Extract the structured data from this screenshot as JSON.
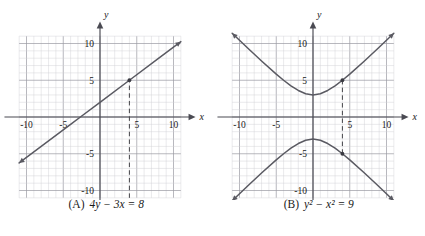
{
  "figure": {
    "background": "#ffffff",
    "panel_count": 2
  },
  "style": {
    "minor_grid_color": "#cfcfd4",
    "major_grid_color": "#9a9aa2",
    "axis_color": "#4a4a52",
    "curve_color": "#5a5a62",
    "dash_color": "#444448",
    "marker_color": "#3a3a42",
    "text_color": "#1a1a1a"
  },
  "panels": [
    {
      "id": "A",
      "caption_label": "(A)",
      "caption_equation": "4y − 3x = 8",
      "axes": {
        "x_label": "x",
        "y_label": "y",
        "x_ticks": [
          "-10",
          "-5",
          "5",
          "10"
        ],
        "x_tick_values": [
          -10,
          -5,
          5,
          10
        ],
        "y_ticks": [
          "10",
          "5",
          "-5",
          "-10"
        ],
        "y_tick_values": [
          10,
          5,
          -5,
          -10
        ],
        "xlim": [
          -11,
          11
        ],
        "ylim": [
          -11,
          11
        ],
        "grid_step": 1,
        "major_grid_step": 5,
        "grid": true
      },
      "dashed_line": {
        "x": 4,
        "y_from": -11,
        "y_to": 5
      },
      "markers": [
        {
          "x": 4,
          "y": 5
        }
      ]
    },
    {
      "id": "B",
      "caption_label": "(B)",
      "caption_equation": "y² − x² = 9",
      "axes": {
        "x_label": "x",
        "y_label": "y",
        "x_ticks": [
          "-10",
          "-5",
          "5",
          "10"
        ],
        "x_tick_values": [
          -10,
          -5,
          5,
          10
        ],
        "y_ticks": [
          "10",
          "5",
          "-5",
          "-10"
        ],
        "y_tick_values": [
          10,
          5,
          -5,
          -10
        ],
        "xlim": [
          -11,
          11
        ],
        "ylim": [
          -11,
          11
        ],
        "grid_step": 1,
        "major_grid_step": 5,
        "grid": true
      },
      "dashed_line": {
        "x": 4,
        "y_from": -5,
        "y_to": 5
      },
      "markers": [
        {
          "x": 4,
          "y": 5
        },
        {
          "x": 4,
          "y": -5
        }
      ]
    }
  ],
  "chart_data": [
    {
      "type": "line",
      "title": "(A) 4y - 3x = 8",
      "xlabel": "x",
      "ylabel": "y",
      "xlim": [
        -11,
        11
      ],
      "ylim": [
        -11,
        11
      ],
      "grid": true,
      "equation": "4y - 3x = 8",
      "form": "y = 0.75x + 2",
      "slope": 0.75,
      "intercept": 2,
      "series": [
        {
          "name": "4y - 3x = 8",
          "x": [
            -11,
            -8,
            -4,
            -2.6667,
            0,
            4,
            8,
            11
          ],
          "y": [
            -6.25,
            -4,
            -1,
            0,
            2,
            5,
            8,
            10.25
          ]
        }
      ],
      "annotations": [
        {
          "kind": "vertical-dashed-line",
          "x": 4,
          "label": "x = 4"
        },
        {
          "kind": "point",
          "x": 4,
          "y": 5
        }
      ],
      "x_tick_labels": [
        "-10",
        "-5",
        "5",
        "10"
      ],
      "y_tick_labels": [
        "10",
        "5",
        "-5",
        "-10"
      ]
    },
    {
      "type": "line",
      "title": "(B) y^2 - x^2 = 9",
      "xlabel": "x",
      "ylabel": "y",
      "xlim": [
        -11,
        11
      ],
      "ylim": [
        -11,
        11
      ],
      "grid": true,
      "equation": "y^2 - x^2 = 9",
      "form": "y = ±sqrt(x^2 + 9)",
      "vertices": [
        [
          0,
          3
        ],
        [
          0,
          -3
        ]
      ],
      "series": [
        {
          "name": "upper branch y = +sqrt(x^2+9)",
          "x": [
            -11,
            -9,
            -7,
            -5,
            -4,
            -3,
            -2,
            -1,
            0,
            1,
            2,
            3,
            4,
            5,
            7,
            9,
            11
          ],
          "y": [
            11.4,
            9.49,
            7.62,
            5.83,
            5,
            4.24,
            3.61,
            3.16,
            3,
            3.16,
            3.61,
            4.24,
            5,
            5.83,
            7.62,
            9.49,
            11.4
          ]
        },
        {
          "name": "lower branch y = -sqrt(x^2+9)",
          "x": [
            -11,
            -9,
            -7,
            -5,
            -4,
            -3,
            -2,
            -1,
            0,
            1,
            2,
            3,
            4,
            5,
            7,
            9,
            11
          ],
          "y": [
            -11.4,
            -9.49,
            -7.62,
            -5.83,
            -5,
            -4.24,
            -3.61,
            -3.16,
            -3,
            -3.16,
            -3.61,
            -4.24,
            -5,
            -5.83,
            -7.62,
            -9.49,
            -11.4
          ]
        }
      ],
      "annotations": [
        {
          "kind": "vertical-dashed-line",
          "x": 4,
          "label": "x = 4"
        },
        {
          "kind": "point",
          "x": 4,
          "y": 5
        },
        {
          "kind": "point",
          "x": 4,
          "y": -5
        }
      ],
      "x_tick_labels": [
        "-10",
        "-5",
        "5",
        "10"
      ],
      "y_tick_labels": [
        "10",
        "5",
        "-5",
        "-10"
      ]
    }
  ]
}
